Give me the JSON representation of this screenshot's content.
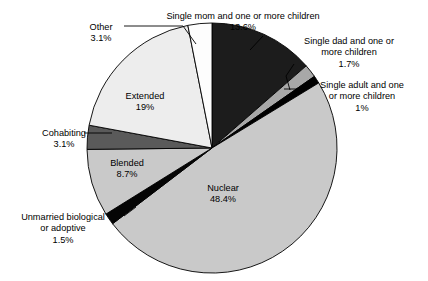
{
  "chart_data": {
    "type": "pie",
    "title": "",
    "subtitle": "",
    "xlabel": "",
    "ylabel": "",
    "legend_position": "none",
    "grid": false,
    "units": "percent",
    "total": 100,
    "start_angle_deg": 0,
    "direction": "clockwise",
    "categories": [
      "Single mom and one or more children",
      "Single dad and one or more children",
      "Single adult and one or more children",
      "Nuclear",
      "Unmarried biological or adoptive",
      "Blended",
      "Cohabiting",
      "Extended",
      "Other"
    ],
    "values": [
      13.6,
      1.7,
      1,
      48.4,
      1.5,
      8.7,
      3.1,
      19,
      3.1
    ],
    "value_labels": [
      "13.6%",
      "1.7%",
      "1%",
      "48.4%",
      "1.5%",
      "8.7%",
      "3.1%",
      "19%",
      "3.1%"
    ],
    "colors": [
      "#1c1c1c",
      "#a8a8a8",
      "#000000",
      "#c9c9c9",
      "#050505",
      "#c9c9c9",
      "#5a5a5a",
      "#ededed",
      "#fdfdfd"
    ],
    "slices": [
      {
        "id": "single-mom",
        "name": "Single mom and one or more children",
        "name_line1": "Single mom and one or more children",
        "name_line2": "",
        "value": 13.6,
        "value_label": "13.6%",
        "color": "#1c1c1c",
        "label_placement": "outside-top",
        "has_leader_line": true
      },
      {
        "id": "single-dad",
        "name": "Single dad and one or more children",
        "name_line1": "Single dad and one or",
        "name_line2": "more children",
        "value": 1.7,
        "value_label": "1.7%",
        "color": "#a8a8a8",
        "label_placement": "outside-right",
        "has_leader_line": true
      },
      {
        "id": "single-adult",
        "name": "Single adult and one or more children",
        "name_line1": "Single adult and one",
        "name_line2": "or more children",
        "value": 1,
        "value_label": "1%",
        "color": "#000000",
        "label_placement": "outside-right",
        "has_leader_line": true
      },
      {
        "id": "nuclear",
        "name": "Nuclear",
        "name_line1": "Nuclear",
        "name_line2": "",
        "value": 48.4,
        "value_label": "48.4%",
        "color": "#c9c9c9",
        "label_placement": "inside",
        "has_leader_line": false
      },
      {
        "id": "unmarried",
        "name": "Unmarried biological or adoptive",
        "name_line1": "Unmarried biological",
        "name_line2": "or adoptive",
        "value": 1.5,
        "value_label": "1.5%",
        "color": "#050505",
        "label_placement": "outside-left",
        "has_leader_line": true
      },
      {
        "id": "blended",
        "name": "Blended",
        "name_line1": "Blended",
        "name_line2": "",
        "value": 8.7,
        "value_label": "8.7%",
        "color": "#c9c9c9",
        "label_placement": "inside",
        "has_leader_line": false
      },
      {
        "id": "cohabiting",
        "name": "Cohabiting",
        "name_line1": "Cohabiting",
        "name_line2": "",
        "value": 3.1,
        "value_label": "3.1%",
        "color": "#5a5a5a",
        "label_placement": "outside-left",
        "has_leader_line": true
      },
      {
        "id": "extended",
        "name": "Extended",
        "name_line1": "Extended",
        "name_line2": "",
        "value": 19,
        "value_label": "19%",
        "color": "#ededed",
        "label_placement": "inside",
        "has_leader_line": false
      },
      {
        "id": "other",
        "name": "Other",
        "name_line1": "Other",
        "name_line2": "",
        "value": 3.1,
        "value_label": "3.1%",
        "color": "#fdfdfd",
        "label_placement": "outside-top-left",
        "has_leader_line": true
      }
    ]
  },
  "labels": {
    "other": {
      "name": "Other",
      "pct": "3.1%"
    },
    "single_mom": {
      "name": "Single mom and one or more children",
      "pct": "13.6%"
    },
    "single_dad": {
      "line1": "Single dad and one or",
      "line2": "more children",
      "pct": "1.7%"
    },
    "single_adult": {
      "line1": "Single adult and one",
      "line2": "or more children",
      "pct": "1%"
    },
    "extended": {
      "name": "Extended",
      "pct": "19%"
    },
    "cohabiting": {
      "name": "Cohabiting",
      "pct": "3.1%"
    },
    "blended": {
      "name": "Blended",
      "pct": "8.7%"
    },
    "nuclear": {
      "name": "Nuclear",
      "pct": "48.4%"
    },
    "unmarried": {
      "line1": "Unmarried biological",
      "line2": "or adoptive",
      "pct": "1.5%"
    }
  },
  "style": {
    "background": "#ffffff",
    "outline": "#000000",
    "text": "#000000"
  }
}
